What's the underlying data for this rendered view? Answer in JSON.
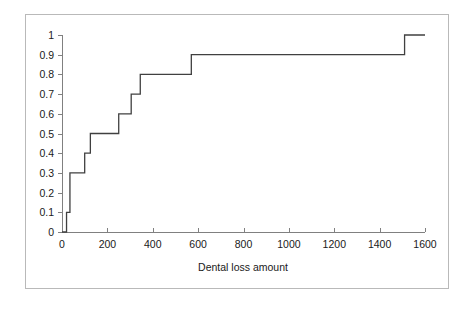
{
  "figure": {
    "frame_color": "#b9b9b9",
    "background": "#ffffff",
    "axis_color": "#808080",
    "series_color": "#404040"
  },
  "axis": {
    "x_title": "Dental loss amount",
    "y_title": "",
    "x_ticks": [
      "0",
      "200",
      "400",
      "600",
      "800",
      "1000",
      "1200",
      "1400",
      "1600"
    ],
    "y_ticks": [
      "0",
      "0.1",
      "0.2",
      "0.3",
      "0.4",
      "0.5",
      "0.6",
      "0.7",
      "0.8",
      "0.9",
      "1"
    ]
  },
  "chart_data": {
    "type": "line",
    "subtype": "empirical-cdf-step",
    "title": "",
    "subtitle": "",
    "xlabel": "Dental loss amount",
    "ylabel": "",
    "xlim": [
      0,
      1600
    ],
    "ylim": [
      0,
      1
    ],
    "xticks": [
      0,
      200,
      400,
      600,
      800,
      1000,
      1200,
      1400,
      1600
    ],
    "yticks": [
      0,
      0.1,
      0.2,
      0.3,
      0.4,
      0.5,
      0.6,
      0.7,
      0.8,
      0.9,
      1
    ],
    "grid": false,
    "legend": null,
    "series": [
      {
        "name": "Cumulative proportion",
        "step": "post",
        "x": [
          0,
          20,
          20,
          35,
          35,
          100,
          100,
          125,
          125,
          250,
          250,
          305,
          305,
          345,
          345,
          570,
          570,
          1510,
          1510,
          1600
        ],
        "y": [
          0,
          0,
          0.1,
          0.1,
          0.3,
          0.3,
          0.4,
          0.4,
          0.5,
          0.5,
          0.6,
          0.6,
          0.7,
          0.7,
          0.8,
          0.8,
          0.9,
          0.9,
          1.0,
          1.0
        ],
        "jump_points": [
          {
            "x": 20,
            "y": 0.1
          },
          {
            "x": 35,
            "y": 0.3
          },
          {
            "x": 100,
            "y": 0.4
          },
          {
            "x": 125,
            "y": 0.5
          },
          {
            "x": 250,
            "y": 0.6
          },
          {
            "x": 305,
            "y": 0.7
          },
          {
            "x": 345,
            "y": 0.8
          },
          {
            "x": 570,
            "y": 0.9
          },
          {
            "x": 1510,
            "y": 1.0
          }
        ]
      }
    ]
  }
}
